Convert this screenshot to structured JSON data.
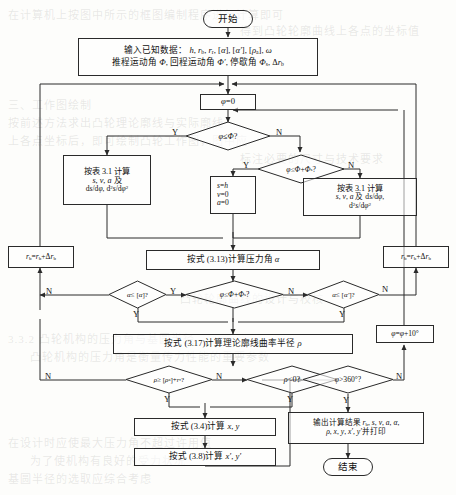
{
  "diagram": {
    "type": "flowchart",
    "language": "zh-CN"
  },
  "bleed_text": [
    {
      "text": "在计算机上按图中所示的框图编制程序进行计算即可",
      "x": 8,
      "y": 6
    },
    {
      "text": "得到凸轮轮廓曲线上各点的坐标值",
      "x": 240,
      "y": 22
    },
    {
      "text": "三、工作图绘制",
      "x": 8,
      "y": 96
    },
    {
      "text": "按前述方法求出凸轮理论廓线与实际廓线",
      "x": 8,
      "y": 114
    },
    {
      "text": "上各点坐标后，即可绘制凸轮工作图，图中应",
      "x": 8,
      "y": 132
    },
    {
      "text": "标注必要的尺寸与技术要求",
      "x": 240,
      "y": 150
    },
    {
      "text": "凸轮轮廓曲线的设计与校核",
      "x": 180,
      "y": 290
    },
    {
      "text": "3.3.2 凸轮机构的压力角与基圆半径",
      "x": 8,
      "y": 330
    },
    {
      "text": "凸轮机构的压力角是衡量传力性能的重要参数",
      "x": 30,
      "y": 348
    },
    {
      "text": "在设计时应使最大压力角不超过许用值",
      "x": 8,
      "y": 434
    },
    {
      "text": "为了使机构有良好的受力状况",
      "x": 30,
      "y": 452
    },
    {
      "text": "基圆半径的选取应综合考虑",
      "x": 8,
      "y": 470
    }
  ],
  "nodes": {
    "start": {
      "label": "开始"
    },
    "input": {
      "line1_pre": "输入已知数据：",
      "line1_vars": "h, r",
      "line1_full": "输入已知数据： h, rb, rr, [α], [α′], [ρa], ω",
      "line2_full": "推程运动角 Φ, 回程运动角 Φ′, 停歇角 Φs, Δrb"
    },
    "phi_init": {
      "label": "φ=0"
    },
    "dec_phi_le_PHI": {
      "label": "φ ≤ Φ?"
    },
    "dec_phi_le_PHI_PHIs": {
      "label": "φ ≤ Φ+Φs?"
    },
    "calc_table_left": {
      "line1": "按表 3.1 计算",
      "line2": "s, v, a 及",
      "line3": "ds/dφ, d²s/dφ²"
    },
    "dwell": {
      "line1": "s=h",
      "line2": "v=0",
      "line3": "a=0"
    },
    "calc_table_right": {
      "line1": "按表 3.1 计算",
      "line2": "s, v, a 及 ds/dφ,",
      "line3": "d²s/dφ²"
    },
    "calc_alpha": {
      "label": "按式 (3.13)计算压力角 α"
    },
    "rb_left": {
      "label": "rb=rb+Δrb"
    },
    "rb_right": {
      "label": "rb=rb+Δrb"
    },
    "dec_alpha_le": {
      "label": "α ≤ [α]?"
    },
    "dec_phi_mid": {
      "label": "φ ≤ Φ+Φs?"
    },
    "dec_alpha_prime_le": {
      "label": "α ≤ [α′]?"
    },
    "calc_rho": {
      "label": "按式 (3.17)计算理论廓线曲率半径 ρ"
    },
    "dec_rho_ge": {
      "label": "ρ ≥ [ρa]+rr?"
    },
    "dec_rho_lt0": {
      "label": "ρ<0?"
    },
    "dec_phi_gt360": {
      "label": "φ>360°?"
    },
    "phi_inc": {
      "label": "φ=φ+10°"
    },
    "calc_xy": {
      "label": "按式 (3.4)计算 x, y"
    },
    "calc_xy_prime": {
      "label": "按式 (3.8)计算 x′, y′"
    },
    "output": {
      "line1": "输出计算结果 rb, s, v, a, α,",
      "line2": "ρ, x, y, x′, y′并打印"
    },
    "end": {
      "label": "结束"
    }
  },
  "edge_labels": {
    "yes": "Y",
    "no": "N"
  },
  "colors": {
    "stroke": "#2a2a2a",
    "text": "#111111",
    "background": "#fdfdfb"
  }
}
